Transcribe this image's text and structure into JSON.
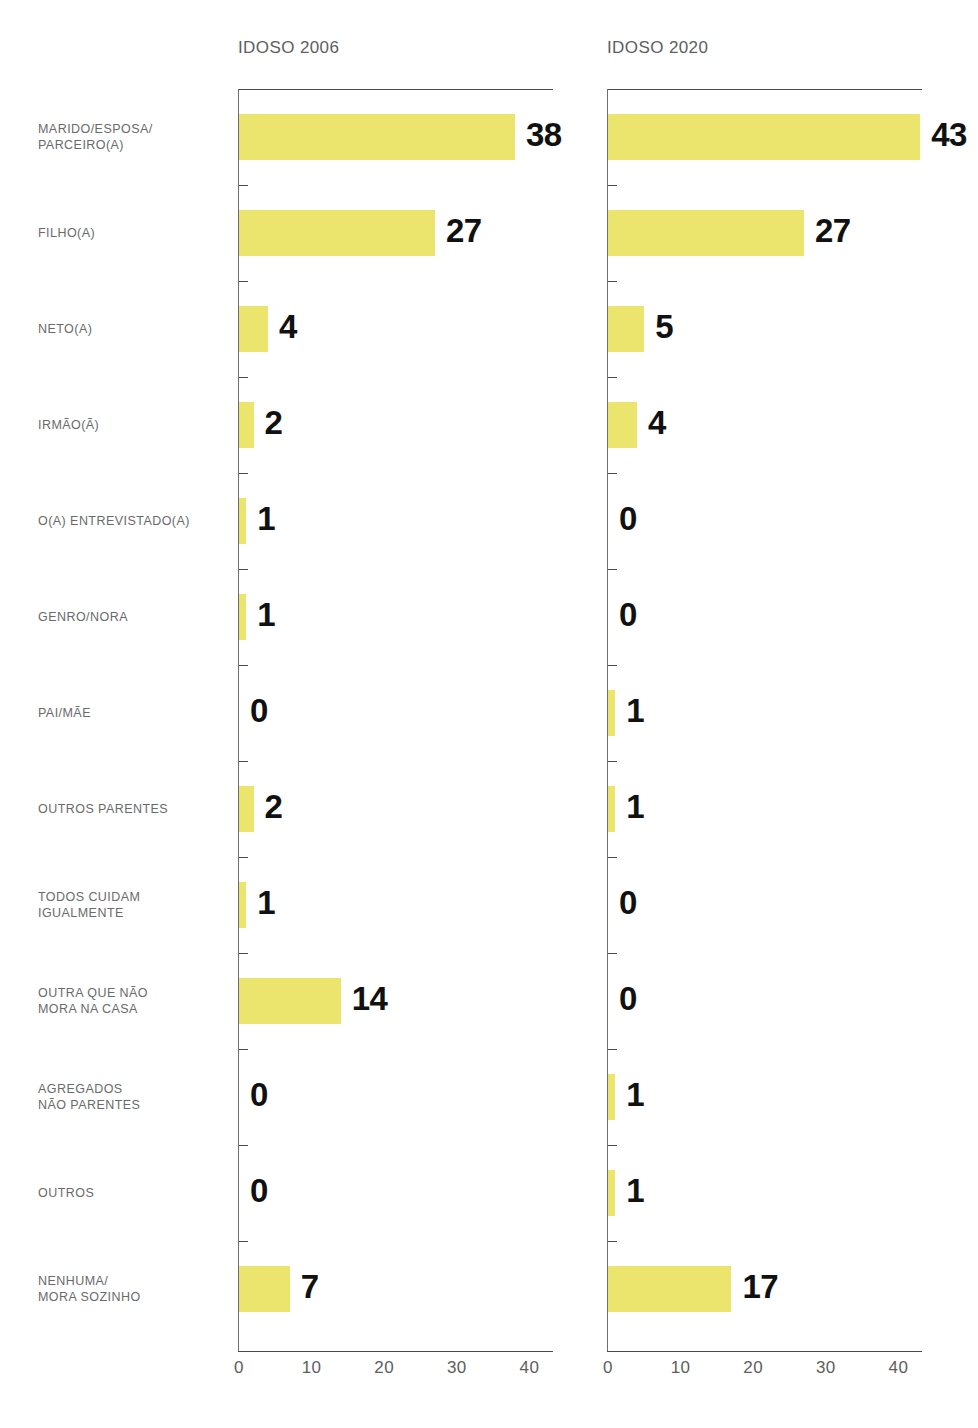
{
  "panels": [
    {
      "id": "left",
      "title": "IDOSO 2006"
    },
    {
      "id": "right",
      "title": "IDOSO 2020"
    }
  ],
  "axis": {
    "ticks": [
      0,
      10,
      20,
      30,
      40
    ],
    "tick_labels": [
      "0",
      "10",
      "20",
      "30",
      "40"
    ],
    "min": 0,
    "max": 43
  },
  "colors": {
    "bar": "#ece56d",
    "label_text": "#6a6a6a",
    "value_text": "#111111",
    "axis": "#4a4a4a",
    "background": "#ffffff"
  },
  "categories": [
    "MARIDO/ESPOSA/\nPARCEIRO(A)",
    "FILHO(A)",
    "NETO(A)",
    "IRMÃO(Ã)",
    "O(A) ENTREVISTADO(A)",
    "GENRO/NORA",
    "PAI/MÃE",
    "OUTROS PARENTES",
    "TODOS CUIDAM\nIGUALMENTE",
    "OUTRA QUE NÃO\nMORA NA CASA",
    "AGREGADOS\nNÃO PARENTES",
    "OUTROS",
    "NENHUMA/\nMORA SOZINHO"
  ],
  "chart_data": {
    "type": "bar",
    "orientation": "horizontal",
    "title": "",
    "xlabel": "",
    "ylabel": "",
    "xlim": [
      0,
      45
    ],
    "grid": false,
    "legend": "none",
    "categories": [
      "MARIDO/ESPOSA/PARCEIRO(A)",
      "FILHO(A)",
      "NETO(A)",
      "IRMÃO(Ã)",
      "O(A) ENTREVISTADO(A)",
      "GENRO/NORA",
      "PAI/MÃE",
      "OUTROS PARENTES",
      "TODOS CUIDAM IGUALMENTE",
      "OUTRA QUE NÃO MORA NA CASA",
      "AGREGADOS NÃO PARENTES",
      "OUTROS",
      "NENHUMA/MORA SOZINHO"
    ],
    "series": [
      {
        "name": "IDOSO 2006",
        "values": [
          38,
          27,
          4,
          2,
          1,
          1,
          0,
          2,
          1,
          14,
          0,
          0,
          7
        ],
        "labels": [
          "38",
          "27",
          "4",
          "2",
          "1",
          "1",
          "0",
          "2",
          "1",
          "14",
          "0",
          "0",
          "7"
        ]
      },
      {
        "name": "IDOSO 2020",
        "values": [
          43,
          27,
          5,
          4,
          0,
          0,
          1,
          1,
          0,
          0,
          1,
          1,
          17
        ],
        "labels": [
          "43",
          "27",
          "5",
          "4",
          "0",
          "0",
          "1",
          "1",
          "0",
          "0",
          "1",
          "1",
          "17"
        ]
      }
    ],
    "xticks": [
      0,
      10,
      20,
      30,
      40
    ]
  }
}
